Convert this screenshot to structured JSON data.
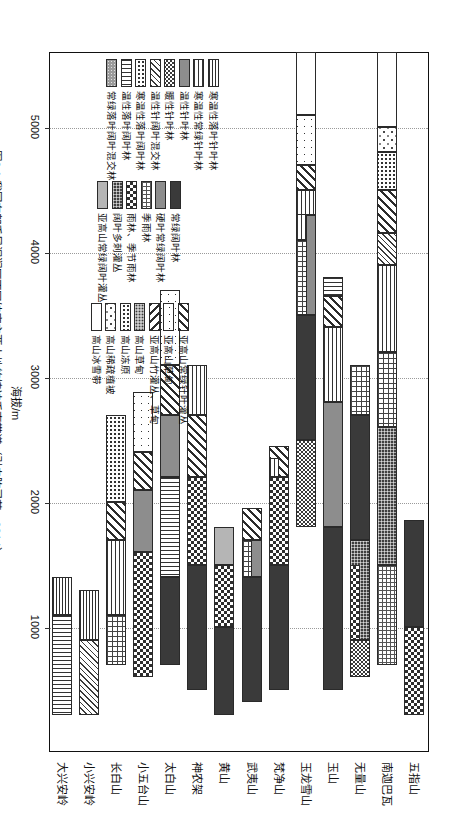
{
  "figure": {
    "caption": "图6.1  我国东部季风湿润区不同纬度主要山地的植被垂直带谱（引自陈灵芝，2014）",
    "axis_title": "海拔/m"
  },
  "chart_data": {
    "type": "bar",
    "title": "我国东部季风湿润区不同纬度主要山地的植被垂直带谱",
    "xlabel": "",
    "ylabel": "海拔/m",
    "ylim": [
      0,
      5600
    ],
    "tick_labels": [
      "1000",
      "2000",
      "3000",
      "4000",
      "5000"
    ],
    "ticks": [
      1000,
      2000,
      3000,
      4000,
      5000
    ],
    "grid": true,
    "orientation": "horizontal-stacked-rotated",
    "categories": [
      "大兴安岭",
      "小兴安岭",
      "长白山",
      "小五台山",
      "太白山",
      "神农架",
      "黄山",
      "武夷山",
      "梵净山",
      "玉龙雪山",
      "玉山",
      "无量山",
      "南迦巴瓦",
      "五指山"
    ],
    "legend_groups": [
      {
        "name": "森林带（寒温性—常绿）",
        "items": [
          {
            "label": "寒温性落叶针叶林",
            "pattern": "p-hlines-dense"
          },
          {
            "label": "寒温性常绿针叶林",
            "pattern": "p-hlines"
          },
          {
            "label": "温性针叶林",
            "pattern": "p-grey"
          },
          {
            "label": "暖性针叶林",
            "pattern": "p-checker-fine"
          },
          {
            "label": "温性针阔叶混交林",
            "pattern": "p-diag-dn-fine"
          },
          {
            "label": "寒温性落叶阔叶林",
            "pattern": "p-dots-dense"
          },
          {
            "label": "温性落叶阔叶林",
            "pattern": "p-vlines"
          },
          {
            "label": "常绿落叶阔叶混交林",
            "pattern": "p-noise-grey"
          }
        ]
      },
      {
        "name": "森林带（常绿—季雨林）",
        "items": [
          {
            "label": "常绿阔叶林",
            "pattern": "p-dark"
          },
          {
            "label": "硬叶常绿阔叶林",
            "pattern": "p-grey"
          },
          {
            "label": "季雨林",
            "pattern": "p-grid-fine"
          },
          {
            "label": "雨林、季节雨林",
            "pattern": "p-checker"
          },
          {
            "label": "阔叶多刺灌丛",
            "pattern": "p-crosshatch-d"
          },
          {
            "label": "亚高山常绿阔叶灌丛",
            "pattern": "p-midgrey"
          }
        ]
      },
      {
        "name": "亚高山—高山带",
        "items": [
          {
            "label": "亚高山常绿针叶灌丛",
            "pattern": "p-diag-dn"
          },
          {
            "label": "亚高山草甸",
            "pattern": "p-dots-sparse"
          },
          {
            "label": "亚高山竹灌丛、草甸",
            "pattern": "p-diag-up"
          },
          {
            "label": "高山草甸",
            "pattern": "p-stipple"
          },
          {
            "label": "高山冻原",
            "pattern": "p-dots-dense"
          },
          {
            "label": "高山稀疏植被",
            "pattern": "p-speck"
          },
          {
            "label": "高山冰雪带",
            "pattern": "p-white"
          }
        ]
      }
    ],
    "series": [
      {
        "category": "大兴安岭",
        "bands": [
          {
            "from": 300,
            "to": 1100,
            "pattern": "p-vlines"
          },
          {
            "from": 1100,
            "to": 1400,
            "pattern": "p-hlines-dense"
          }
        ]
      },
      {
        "category": "小兴安岭",
        "bands": [
          {
            "from": 300,
            "to": 900,
            "pattern": "p-diag-dn-fine"
          },
          {
            "from": 900,
            "to": 1300,
            "pattern": "p-hlines-dense"
          }
        ]
      },
      {
        "category": "长白山",
        "bands": [
          {
            "from": 700,
            "to": 1100,
            "pattern": "p-grid-med"
          },
          {
            "from": 1100,
            "to": 1700,
            "pattern": "p-hlines"
          },
          {
            "from": 1700,
            "to": 2000,
            "pattern": "p-diag-dn"
          },
          {
            "from": 2000,
            "to": 2700,
            "pattern": "p-dots-dense"
          }
        ]
      },
      {
        "category": "小五台山",
        "bands": [
          {
            "from": 600,
            "to": 1600,
            "pattern": "p-checker"
          },
          {
            "from": 1600,
            "to": 2100,
            "pattern": "p-grey"
          },
          {
            "from": 2100,
            "to": 2400,
            "pattern": "p-diag-dn"
          },
          {
            "from": 2400,
            "to": 2880,
            "pattern": "p-dots-sparse"
          }
        ]
      },
      {
        "category": "太白山",
        "bands": [
          {
            "from": 700,
            "to": 1400,
            "pattern": "p-dark"
          },
          {
            "from": 1400,
            "to": 2200,
            "pattern": "p-vlines"
          },
          {
            "from": 2200,
            "to": 2700,
            "pattern": "p-grey"
          },
          {
            "from": 2700,
            "to": 3100,
            "pattern": "p-diag-dn"
          },
          {
            "from": 3100,
            "to": 3700,
            "pattern": "p-dots-sparse"
          }
        ]
      },
      {
        "category": "神农架",
        "bands": [
          {
            "from": 500,
            "to": 1500,
            "pattern": "p-dark"
          },
          {
            "from": 1500,
            "to": 2200,
            "pattern": "p-checker"
          },
          {
            "from": 2200,
            "to": 2700,
            "pattern": "p-diag-dn"
          },
          {
            "from": 2700,
            "to": 3100,
            "pattern": "p-hlines"
          }
        ]
      },
      {
        "category": "黄山",
        "bands": [
          {
            "from": 300,
            "to": 1000,
            "pattern": "p-dark"
          },
          {
            "from": 1000,
            "to": 1500,
            "pattern": "p-checker"
          },
          {
            "from": 1500,
            "to": 1800,
            "pattern": "p-midgrey"
          }
        ]
      },
      {
        "category": "武夷山",
        "bands": [
          {
            "from": 400,
            "to": 1400,
            "pattern": "p-dark"
          },
          {
            "from": 1400,
            "to": 1700,
            "pattern": "p-grey"
          },
          {
            "from": 1400,
            "to": 1700,
            "pattern": "p-grid-med",
            "sub": "bottom"
          },
          {
            "from": 1700,
            "to": 1950,
            "pattern": "p-diag-dn"
          }
        ]
      },
      {
        "category": "梵净山",
        "bands": [
          {
            "from": 500,
            "to": 1500,
            "pattern": "p-dark"
          },
          {
            "from": 1500,
            "to": 2200,
            "pattern": "p-checker"
          },
          {
            "from": 2200,
            "to": 2450,
            "pattern": "p-diag-dn"
          },
          {
            "from": 2200,
            "to": 2350,
            "pattern": "p-hlines",
            "sub": "bottom"
          }
        ]
      },
      {
        "category": "玉龙雪山",
        "bands": [
          {
            "from": 1800,
            "to": 2500,
            "pattern": "p-checker-fine"
          },
          {
            "from": 2500,
            "to": 3500,
            "pattern": "p-dark"
          },
          {
            "from": 3500,
            "to": 4100,
            "pattern": "p-grid-med"
          },
          {
            "from": 3500,
            "to": 4300,
            "pattern": "p-grey",
            "sub": "top"
          },
          {
            "from": 4100,
            "to": 4400,
            "pattern": "p-hlines",
            "sub": "bottom"
          },
          {
            "from": 4300,
            "to": 4500,
            "pattern": "p-hlines"
          },
          {
            "from": 4500,
            "to": 4700,
            "pattern": "p-diag-dn"
          },
          {
            "from": 4700,
            "to": 5100,
            "pattern": "p-dots-sparse"
          },
          {
            "from": 5100,
            "to": 5600,
            "pattern": "p-white"
          }
        ]
      },
      {
        "category": "玉山",
        "bands": [
          {
            "from": 500,
            "to": 1800,
            "pattern": "p-dark"
          },
          {
            "from": 1800,
            "to": 2800,
            "pattern": "p-grey"
          },
          {
            "from": 2800,
            "to": 3400,
            "pattern": "p-hlines"
          },
          {
            "from": 3400,
            "to": 3650,
            "pattern": "p-diag-dn"
          },
          {
            "from": 3650,
            "to": 3800,
            "pattern": "p-vlines"
          }
        ]
      },
      {
        "category": "无量山",
        "bands": [
          {
            "from": 600,
            "to": 900,
            "pattern": "p-checker-fine"
          },
          {
            "from": 900,
            "to": 1700,
            "pattern": "p-crosshatch-d"
          },
          {
            "from": 900,
            "to": 1500,
            "pattern": "p-checker",
            "sub": "bottom"
          },
          {
            "from": 1700,
            "to": 2700,
            "pattern": "p-dark"
          },
          {
            "from": 2700,
            "to": 3100,
            "pattern": "p-grid-med"
          }
        ]
      },
      {
        "category": "南迦巴瓦",
        "bands": [
          {
            "from": 700,
            "to": 1500,
            "pattern": "p-grid-fine"
          },
          {
            "from": 1500,
            "to": 2600,
            "pattern": "p-crosshatch-d"
          },
          {
            "from": 2600,
            "to": 3200,
            "pattern": "p-grid-med"
          },
          {
            "from": 3200,
            "to": 3900,
            "pattern": "p-hlines"
          },
          {
            "from": 3900,
            "to": 4150,
            "pattern": "p-diag-dn-fine"
          },
          {
            "from": 4150,
            "to": 4500,
            "pattern": "p-diag-dn"
          },
          {
            "from": 4500,
            "to": 4800,
            "pattern": "p-dots-dense"
          },
          {
            "from": 4800,
            "to": 5000,
            "pattern": "p-speck"
          },
          {
            "from": 5000,
            "to": 5600,
            "pattern": "p-white"
          }
        ]
      },
      {
        "category": "五指山",
        "bands": [
          {
            "from": 300,
            "to": 1000,
            "pattern": "p-checker"
          },
          {
            "from": 1000,
            "to": 1860,
            "pattern": "p-dark"
          }
        ]
      }
    ]
  }
}
